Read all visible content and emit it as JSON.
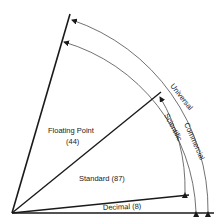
{
  "diagram": {
    "type": "sector-diagram",
    "sectors": [
      {
        "name": "Floating Point",
        "count": "(44)"
      },
      {
        "name": "Standard",
        "count": "(87)"
      },
      {
        "name": "Decimal",
        "count": "(8)"
      }
    ],
    "labels": {
      "floating_point": "Floating Point",
      "floating_point_count": "(44)",
      "standard": "Standard (87)",
      "decimal": "Decimal (8)",
      "universal": "Universal",
      "commercial": "Commercial",
      "scientific": "Scientific"
    },
    "arcs": [
      {
        "name": "Universal",
        "spans": [
          "Floating Point",
          "Standard",
          "Decimal"
        ]
      },
      {
        "name": "Commercial",
        "spans": [
          "Floating Point",
          "Standard",
          "Decimal"
        ]
      },
      {
        "name": "Scientific",
        "spans": [
          "Standard"
        ]
      }
    ],
    "colors": {
      "line": "#1a1a1a",
      "background": "#ffffff"
    }
  }
}
